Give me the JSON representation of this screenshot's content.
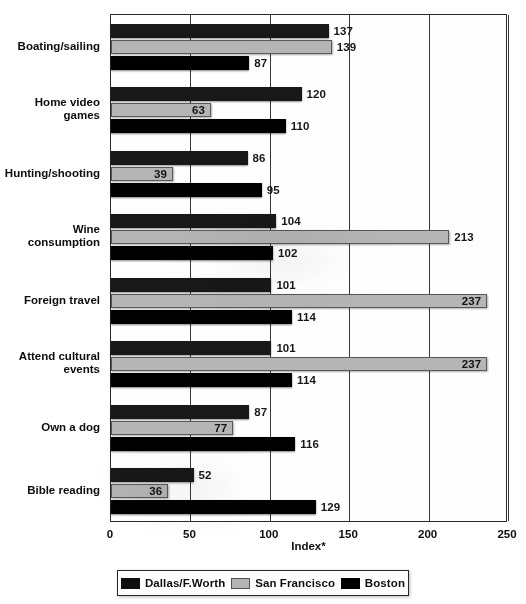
{
  "chart_data": {
    "type": "bar",
    "orientation": "horizontal",
    "title": "",
    "xlabel": "Index*",
    "ylabel": "",
    "xlim": [
      0,
      250
    ],
    "xticks": [
      0,
      50,
      100,
      150,
      200,
      250
    ],
    "grid": true,
    "legend_position": "bottom",
    "categories": [
      "Boating/sailing",
      "Home video games",
      "Hunting/shooting",
      "Wine consumption",
      "Foreign travel",
      "Attend cultural\nevents",
      "Own a dog",
      "Bible reading"
    ],
    "series": [
      {
        "name": "Dallas/F.Worth",
        "color": "#1c1c1c",
        "values": [
          137,
          120,
          86,
          104,
          101,
          101,
          87,
          52
        ]
      },
      {
        "name": "San Francisco",
        "color": "#b4b4b4",
        "values": [
          139,
          63,
          39,
          213,
          237,
          237,
          77,
          36
        ]
      },
      {
        "name": "Boston",
        "color": "#000000",
        "values": [
          87,
          110,
          95,
          102,
          114,
          114,
          116,
          129
        ]
      }
    ],
    "label_placement": [
      [
        "outside",
        "outside",
        "outside"
      ],
      [
        "outside",
        "inside",
        "outside"
      ],
      [
        "outside",
        "inside",
        "outside"
      ],
      [
        "outside",
        "outside",
        "outside"
      ],
      [
        "outside",
        "inside",
        "outside"
      ],
      [
        "outside",
        "inside",
        "outside"
      ],
      [
        "outside",
        "inside",
        "outside"
      ],
      [
        "outside",
        "inside",
        "outside"
      ]
    ]
  },
  "axis": {
    "tick_labels": [
      "0",
      "50",
      "100",
      "150",
      "200",
      "250"
    ],
    "title": "Index*"
  },
  "legend": {
    "items": [
      {
        "label": "Dallas/F.Worth",
        "swatch": "s0"
      },
      {
        "label": "San Francisco",
        "swatch": "s1"
      },
      {
        "label": "Boston",
        "swatch": "s2"
      }
    ]
  }
}
